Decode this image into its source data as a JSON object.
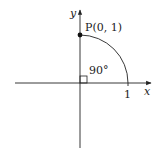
{
  "diagram": {
    "type": "unit-circle-quarter-arc",
    "axes": {
      "x_label": "x",
      "y_label": "y"
    },
    "point": {
      "label": "P(0, 1)",
      "coords": [
        0,
        1
      ]
    },
    "angle": {
      "label": "90°",
      "marker": "right-angle-square"
    },
    "tick": {
      "label": "1",
      "position": [
        1,
        0
      ]
    },
    "colors": {
      "stroke": "#222222",
      "background": "#ffffff"
    }
  }
}
